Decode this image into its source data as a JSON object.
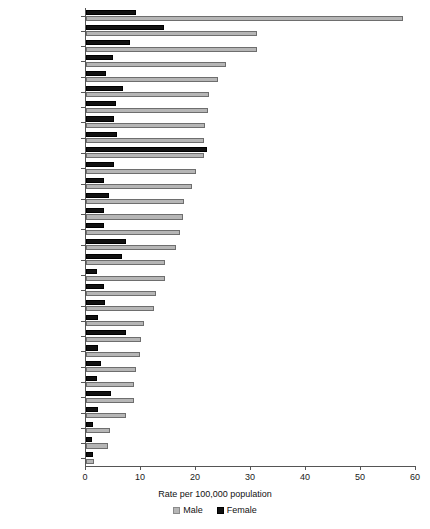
{
  "chart_data": {
    "type": "bar",
    "orientation": "horizontal",
    "title": "",
    "xlabel": "Rate per 100,000 population",
    "ylabel": "",
    "xlim": [
      0,
      60
    ],
    "xticks": [
      0,
      10,
      20,
      30,
      40,
      50,
      60
    ],
    "grid": false,
    "legend_position": "bottom",
    "categories": [
      "Russia '00",
      "New Zealand '99",
      "Finland '00",
      "Ireland '99",
      "Scotland '99",
      "Northern Ireland '99",
      "Australia '99",
      "Canada '98",
      "Austria '00",
      "Belgium '96",
      "Switzerland '99",
      "Poland '00",
      "Hungary '00",
      "Czech Republic '00",
      "USA '99",
      "Japan '99",
      "Sweden '99",
      "Slovakia '00",
      "Germany '99",
      "France '99",
      "Denmark '98",
      "Korea '00",
      "Israel '99",
      "England & Wales '99",
      "Norway '99",
      "Netherlands '99",
      "Italy '99",
      "Greece '99",
      "Portugal '00",
      "Spain '98"
    ],
    "series": [
      {
        "name": "Male",
        "color": "#b6b6b6",
        "values": [
          57.6,
          31.1,
          31.0,
          25.5,
          24.0,
          22.3,
          22.2,
          21.6,
          21.5,
          21.4,
          20.0,
          19.3,
          17.9,
          17.6,
          17.1,
          16.4,
          14.4,
          14.3,
          12.7,
          12.3,
          10.5,
          10.0,
          9.9,
          9.0,
          8.8,
          8.7,
          7.2,
          4.4,
          4.0,
          1.4
        ]
      },
      {
        "name": "Female",
        "color": "#111111",
        "values": [
          9.0,
          14.2,
          8.0,
          4.9,
          3.7,
          6.7,
          5.4,
          5.1,
          5.7,
          22.0,
          5.1,
          3.2,
          4.2,
          3.3,
          3.2,
          7.3,
          6.5,
          2.0,
          3.2,
          3.5,
          2.2,
          7.2,
          2.2,
          2.7,
          2.0,
          4.5,
          2.2,
          1.2,
          1.1,
          1.3
        ]
      }
    ]
  },
  "legend": {
    "male_label": "Male",
    "female_label": "Female"
  }
}
